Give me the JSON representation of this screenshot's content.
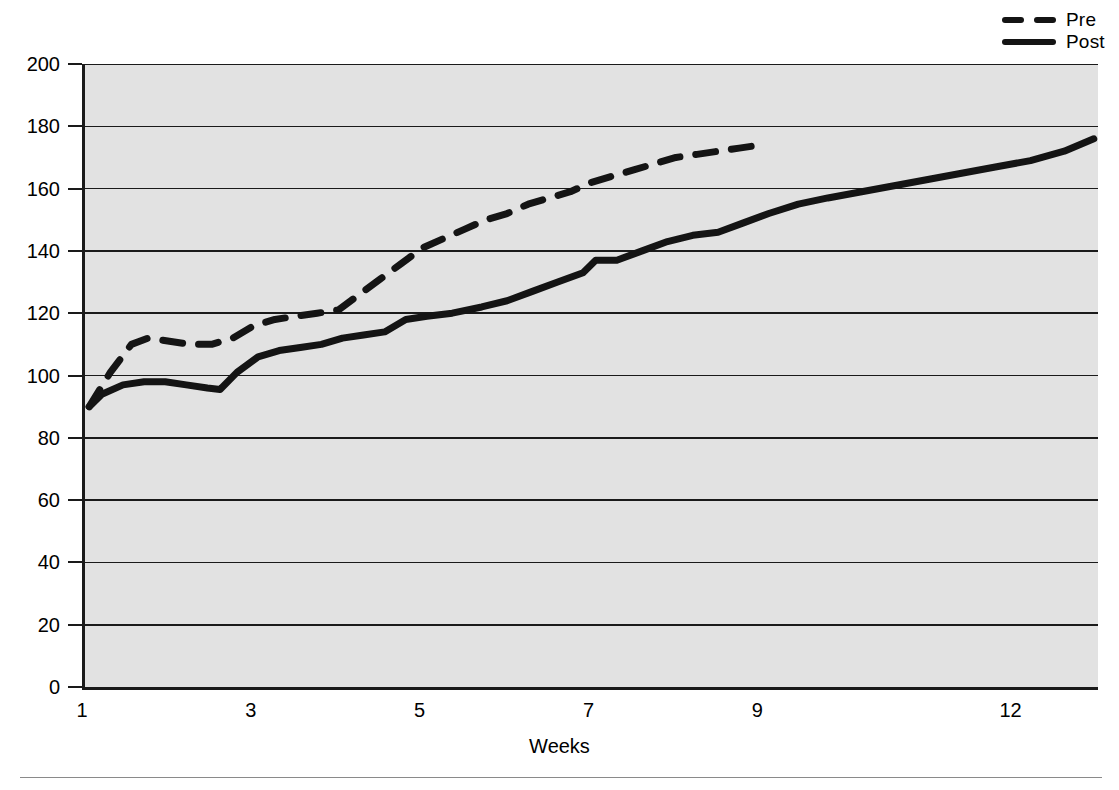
{
  "chart_data": {
    "type": "line",
    "title": "",
    "xlabel": "Weeks",
    "ylabel": "",
    "xlim": [
      1,
      13
    ],
    "ylim": [
      0,
      200
    ],
    "grid": true,
    "grid_axis": "y",
    "legend_position": "top-right",
    "background": "#e2e2e2",
    "line_color": "#141414",
    "xticks": [
      1,
      3,
      5,
      7,
      9,
      12
    ],
    "xtick_labels": [
      "1",
      "3",
      "5",
      "7",
      "9",
      "12"
    ],
    "yticks": [
      0,
      20,
      40,
      60,
      80,
      100,
      120,
      140,
      160,
      180,
      200
    ],
    "ytick_labels": [
      "0",
      "20",
      "40",
      "60",
      "80",
      "100",
      "120",
      "140",
      "160",
      "180",
      "200"
    ],
    "series": [
      {
        "name": "Pre",
        "style": "dashed",
        "x": [
          1.05,
          1.3,
          1.55,
          1.75,
          2.0,
          2.25,
          2.5,
          2.75,
          3.0,
          3.25,
          3.5,
          3.75,
          4.0,
          4.25,
          4.5,
          4.75,
          5.0,
          5.25,
          5.5,
          5.75,
          6.0,
          6.25,
          6.5,
          6.75,
          7.0,
          7.25,
          7.5,
          7.75,
          8.0,
          8.25,
          8.5,
          8.75,
          9.0
        ],
        "y": [
          90,
          101,
          110,
          112,
          111,
          110,
          110,
          112,
          116,
          118,
          119,
          120,
          121,
          126,
          131,
          136,
          141,
          144,
          147,
          150,
          152,
          155,
          157,
          159,
          162,
          164,
          166,
          168,
          170,
          171,
          172,
          173,
          174
        ]
      },
      {
        "name": "Post",
        "style": "solid",
        "x": [
          1.05,
          1.2,
          1.45,
          1.7,
          1.95,
          2.2,
          2.45,
          2.6,
          2.8,
          3.05,
          3.3,
          3.55,
          3.8,
          4.05,
          4.3,
          4.55,
          4.8,
          5.05,
          5.35,
          5.7,
          6.0,
          6.3,
          6.6,
          6.9,
          7.05,
          7.3,
          7.6,
          7.9,
          8.2,
          8.5,
          8.8,
          9.1,
          9.45,
          9.8,
          10.2,
          10.6,
          11.0,
          11.4,
          11.8,
          12.2,
          12.6,
          12.95
        ],
        "y": [
          90,
          94,
          97,
          98,
          98,
          97,
          96,
          95.5,
          101,
          106,
          108,
          109,
          110,
          112,
          113,
          114,
          118,
          119,
          120,
          122,
          124,
          127,
          130,
          133,
          137,
          137,
          140,
          143,
          145,
          146,
          149,
          152,
          155,
          157,
          159,
          161,
          163,
          165,
          167,
          169,
          172,
          176
        ]
      }
    ]
  },
  "legend": {
    "items": [
      {
        "label": "Pre",
        "style": "dashed"
      },
      {
        "label": "Post",
        "style": "solid"
      }
    ]
  },
  "axis": {
    "x_title": "Weeks"
  }
}
